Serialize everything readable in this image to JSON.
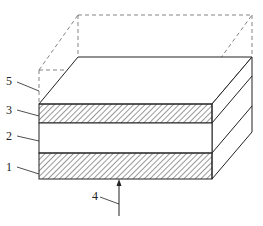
{
  "figure": {
    "type": "layered-stack-isometric",
    "colors": {
      "stroke": "#222222",
      "dashed": "#666666",
      "hatch": "#333333",
      "background": "#ffffff"
    }
  },
  "labels": {
    "l1": "1",
    "l2": "2",
    "l3": "3",
    "l4": "4",
    "l5": "5"
  },
  "layers": [
    {
      "id": "1",
      "fill": "hatched",
      "position": "bottom"
    },
    {
      "id": "2",
      "fill": "plain",
      "position": "middle"
    },
    {
      "id": "3",
      "fill": "hatched",
      "position": "top"
    }
  ],
  "annotations": [
    {
      "id": "4",
      "description": "upward arrow pointing to bottom face"
    },
    {
      "id": "5",
      "description": "dashed outline box above stack"
    }
  ]
}
